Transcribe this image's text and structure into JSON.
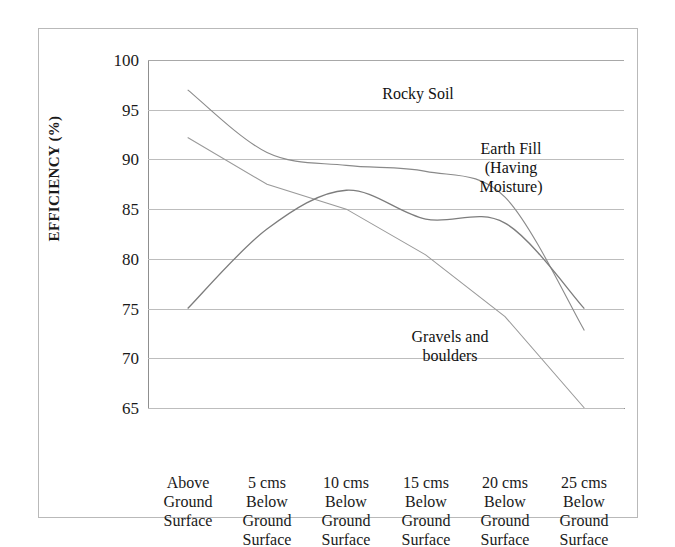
{
  "chart_data": {
    "type": "line",
    "title": "",
    "xlabel": "",
    "ylabel": "EFFICIENCY  (%)",
    "ylim": [
      65,
      100
    ],
    "yticks": [
      65,
      70,
      75,
      80,
      85,
      90,
      95,
      100
    ],
    "grid": true,
    "legend_position": "inline-annotations",
    "categories": [
      "Above\nGround\nSurface",
      "5 cms\nBelow\nGround\nSurface",
      "10 cms\nBelow\nGround\nSurface",
      "15 cms\nBelow\nGround\nSurface",
      "20 cms\nBelow\nGround\nSurface",
      "25 cms\nBelow\nGround\nSurface"
    ],
    "series": [
      {
        "name": "Rocky Soil",
        "values": [
          97.0,
          90.7,
          89.4,
          88.8,
          86.2,
          72.8
        ]
      },
      {
        "name": "Gravels and boulders",
        "values": [
          92.2,
          87.5,
          85.0,
          80.4,
          74.2,
          65.0
        ]
      },
      {
        "name": "Earth Fill (Having Moisture)",
        "values": [
          75.0,
          83.0,
          86.9,
          84.0,
          83.6,
          75.0
        ]
      }
    ],
    "annotations": [
      {
        "text": "Rocky Soil",
        "x_px": 300,
        "y_px": 90
      },
      {
        "text": "Earth Fill\n(Having\nMoisture)",
        "x_px": 483,
        "y_px": 145
      },
      {
        "text": "Gravels and\nboulders",
        "x_px": 443,
        "y_px": 333
      }
    ]
  },
  "axis": {
    "y_title": "EFFICIENCY  (%)",
    "y_ticks": [
      "100",
      "95",
      "90",
      "85",
      "80",
      "75",
      "70",
      "65"
    ],
    "x_ticks": [
      "Above\nGround\nSurface",
      "5 cms\nBelow\nGround\nSurface",
      "10 cms\nBelow\nGround\nSurface",
      "15 cms\nBelow\nGround\nSurface",
      "20 cms\nBelow\nGround\nSurface",
      "25 cms\nBelow\nGround\nSurface"
    ]
  },
  "labels": {
    "rocky_soil": "Rocky Soil",
    "earth_fill": "Earth Fill\n(Having\nMoisture)",
    "gravels": "Gravels and\nboulders"
  },
  "colors": {
    "line": "#8a8a8a",
    "grid": "#bdbdbd",
    "axis": "#8f8f8f",
    "text": "#1a1a1a",
    "frame": "#b9b9b9"
  }
}
